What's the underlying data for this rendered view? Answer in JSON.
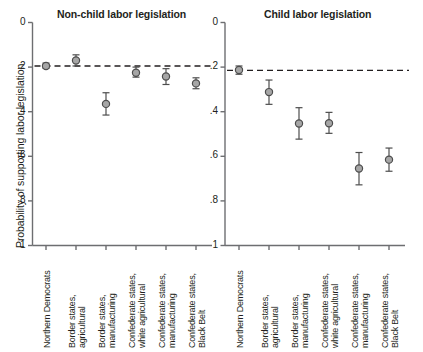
{
  "figure": {
    "ylabel": "Probability of supporting labor legislation",
    "ytick_labels": [
      "1",
      ".8",
      ".6",
      ".4",
      ".2",
      "0"
    ],
    "ytick_values": [
      1,
      0.8,
      0.6,
      0.4,
      0.2,
      0
    ],
    "marker_fill": "#a6a6a6",
    "marker_stroke": "#4d4d4d",
    "axis_color": "#6d6e71",
    "refline_color": "#231f20"
  },
  "chart_data": {
    "type": "scatter",
    "xlabel": "",
    "ylabel": "Probability of supporting labor legislation",
    "ylim": [
      0,
      1
    ],
    "yticks": [
      0,
      0.2,
      0.4,
      0.6,
      0.8,
      1
    ],
    "grid": false,
    "legend": "none",
    "error_bars": "95% confidence interval",
    "categories": [
      "Northern Democrats",
      "Border states, agricultural",
      "Border states, manufacturing",
      "Confederate states, white agricultural",
      "Confederate states, manufacturing",
      "Confederate states, Black Belt"
    ],
    "panels": [
      {
        "name": "non-child",
        "title": "Non-child labor legislation",
        "reference_line": 0.805,
        "points": [
          {
            "category": "Northern Democrats",
            "value": 0.805,
            "lower": 0.795,
            "upper": 0.818
          },
          {
            "category": "Border states, agricultural",
            "value": 0.83,
            "lower": 0.805,
            "upper": 0.855
          },
          {
            "category": "Border states, manufacturing",
            "value": 0.635,
            "lower": 0.585,
            "upper": 0.685
          },
          {
            "category": "Confederate states, white agricultural",
            "value": 0.775,
            "lower": 0.755,
            "upper": 0.8
          },
          {
            "category": "Confederate states, manufacturing",
            "value": 0.758,
            "lower": 0.722,
            "upper": 0.793
          },
          {
            "category": "Confederate states, Black Belt",
            "value": 0.727,
            "lower": 0.703,
            "upper": 0.752
          }
        ]
      },
      {
        "name": "child",
        "title": "Child labor legislation",
        "reference_line": 0.785,
        "points": [
          {
            "category": "Northern Democrats",
            "value": 0.787,
            "lower": 0.768,
            "upper": 0.805
          },
          {
            "category": "Border states, agricultural",
            "value": 0.688,
            "lower": 0.633,
            "upper": 0.742
          },
          {
            "category": "Border states, manufacturing",
            "value": 0.547,
            "lower": 0.477,
            "upper": 0.618
          },
          {
            "category": "Confederate states, white agricultural",
            "value": 0.548,
            "lower": 0.503,
            "upper": 0.597
          },
          {
            "category": "Confederate states, manufacturing",
            "value": 0.345,
            "lower": 0.272,
            "upper": 0.417
          },
          {
            "category": "Confederate states, Black Belt",
            "value": 0.385,
            "lower": 0.333,
            "upper": 0.437
          }
        ]
      }
    ]
  }
}
